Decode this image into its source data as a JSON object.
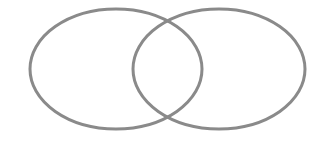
{
  "diagram": {
    "type": "venn",
    "background": "#ffffff",
    "stroke_color": "#8a8a8a",
    "stroke_width": 3,
    "sets": [
      {
        "id": "left",
        "cx": 116,
        "cy": 69,
        "rx": 86,
        "ry": 60,
        "label": ""
      },
      {
        "id": "right",
        "cx": 219,
        "cy": 69,
        "rx": 86,
        "ry": 60,
        "label": ""
      }
    ]
  }
}
